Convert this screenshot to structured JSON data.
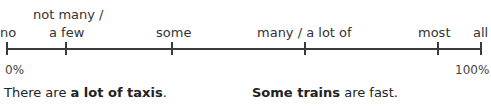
{
  "scale": {
    "labels": [
      {
        "line1": "",
        "line2": "no",
        "x": 7
      },
      {
        "line1": "not many /",
        "line2": "a few",
        "x": 66
      },
      {
        "line1": "",
        "line2": "some",
        "x": 172
      },
      {
        "line1": "",
        "line2": "many / a lot of",
        "x": 305
      },
      {
        "line1": "",
        "line2": "most",
        "x": 438
      },
      {
        "line1": "",
        "line2": "all",
        "x": 481
      }
    ],
    "start_percent": "0%",
    "end_percent": "100%"
  },
  "examples": [
    {
      "pre": "There are ",
      "bold": "a lot of taxis",
      "post": "."
    },
    {
      "pre": "",
      "bold": "Some trains",
      "post": " are fast."
    }
  ]
}
